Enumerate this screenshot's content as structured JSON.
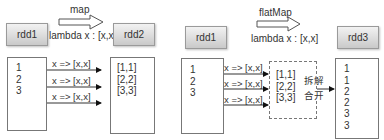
{
  "map_panel": {
    "source_label": "rdd1",
    "target_label": "rdd2",
    "operation": "map",
    "lambda": "lambda x : [x,x]",
    "source_rows": [
      "1",
      "2",
      "3"
    ],
    "transform_labels": [
      "x => [x,x]",
      "x => [x,x]",
      "x => [x,x]"
    ],
    "target_rows": [
      "[1,1]",
      "[2,2]",
      "[3,3]"
    ]
  },
  "flatmap_panel": {
    "source_label": "rdd1",
    "target_label": "rdd3",
    "operation": "flatMap",
    "lambda": "lambda x : [x,x]",
    "source_rows": [
      "1",
      "2",
      "3"
    ],
    "transform_labels": [
      "x => [x,x]",
      "x => [x,x]",
      "x => [x,x]"
    ],
    "intermediate_rows": [
      "[1,1]",
      "[2,2]",
      "[3,3]"
    ],
    "flatten_label_line1": "拆解",
    "flatten_label_line2": "合开",
    "target_rows": [
      "1",
      "1",
      "2",
      "2",
      "3",
      "3"
    ]
  }
}
